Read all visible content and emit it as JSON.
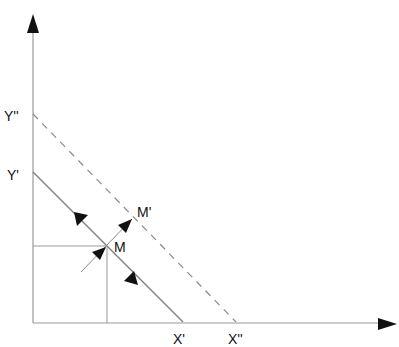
{
  "diagram": {
    "type": "economics-budget-line-shift",
    "colors": {
      "background": "#ffffff",
      "axis": "#9a9a9a",
      "line": "#7a7a7a",
      "arrowhead": "#111111",
      "text": "#111111"
    },
    "labels": {
      "y_double_prime": "Y''",
      "y_prime": "Y'",
      "x_prime": "X'",
      "x_double_prime": "X''",
      "point_m": "M",
      "point_m_prime": "M'"
    },
    "lines": {
      "budget_line_original": {
        "from": "Y'",
        "to": "X'",
        "style": "solid"
      },
      "budget_line_shifted": {
        "from": "Y''",
        "to": "X''",
        "style": "dashed"
      },
      "shift_vector": {
        "from": "M",
        "to": "M'"
      },
      "guide_horizontal": {
        "to": "M"
      },
      "guide_vertical": {
        "to": "M"
      }
    }
  }
}
